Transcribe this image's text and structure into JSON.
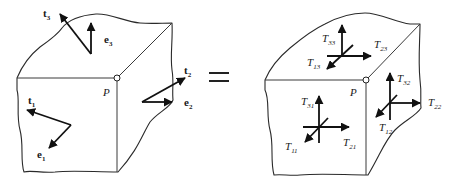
{
  "diagram": {
    "colors": {
      "line": "#2a2a2a",
      "vector": "#111111",
      "background": "#ffffff"
    },
    "equals_symbol": "=",
    "left_figure": {
      "point_label": "P",
      "vectors": [
        {
          "id": "t3",
          "base": "t",
          "sub": "3",
          "style": "bold"
        },
        {
          "id": "e3",
          "base": "e",
          "sub": "3",
          "style": "bold"
        },
        {
          "id": "t2",
          "base": "t",
          "sub": "2",
          "style": "bold"
        },
        {
          "id": "e2",
          "base": "e",
          "sub": "2",
          "style": "bold"
        },
        {
          "id": "t1",
          "base": "t",
          "sub": "1",
          "style": "bold"
        },
        {
          "id": "e1",
          "base": "e",
          "sub": "1",
          "style": "bold"
        }
      ]
    },
    "right_figure": {
      "point_label": "P",
      "components": [
        {
          "id": "T33",
          "base": "T",
          "sub": "33",
          "face": "top"
        },
        {
          "id": "T23",
          "base": "T",
          "sub": "23",
          "face": "top"
        },
        {
          "id": "T13",
          "base": "T",
          "sub": "13",
          "face": "top"
        },
        {
          "id": "T32",
          "base": "T",
          "sub": "32",
          "face": "right"
        },
        {
          "id": "T22",
          "base": "T",
          "sub": "22",
          "face": "right"
        },
        {
          "id": "T12",
          "base": "T",
          "sub": "12",
          "face": "right"
        },
        {
          "id": "T31",
          "base": "T",
          "sub": "31",
          "face": "front"
        },
        {
          "id": "T21",
          "base": "T",
          "sub": "21",
          "face": "front"
        },
        {
          "id": "T11",
          "base": "T",
          "sub": "11",
          "face": "front"
        }
      ]
    }
  }
}
